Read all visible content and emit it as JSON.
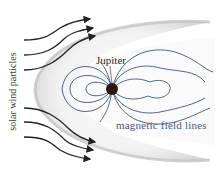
{
  "diagram": {
    "labels": {
      "planet": "Jupiter",
      "field_lines": "magnetic field lines",
      "solar_wind": "solar wind particles"
    },
    "colors": {
      "field_lines": "#3e5577",
      "wind_arrows": "#222222",
      "planet": "#2a1a14",
      "magnetosphere_fill": "#e6e6e6",
      "background": "#ffffff"
    },
    "wind_arrows_count": 6
  }
}
